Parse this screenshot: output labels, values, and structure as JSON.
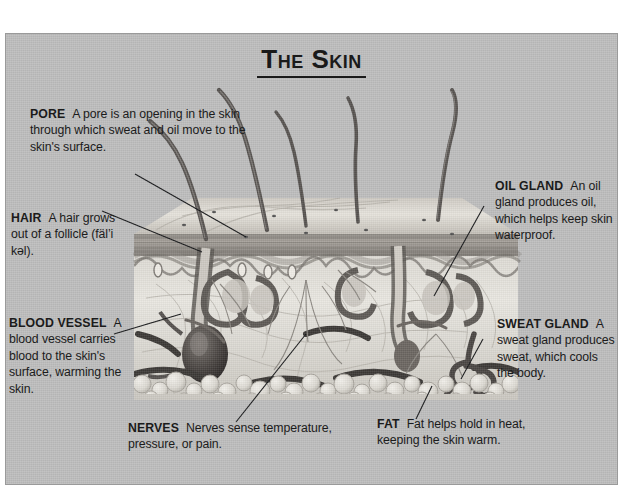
{
  "figure": {
    "title": "The Skin",
    "background_color": "#bdbdbd",
    "border_color": "#9a9a9a",
    "text_color": "#1b1b1b"
  },
  "callouts": [
    {
      "id": "pore",
      "term": "PORE",
      "text": "A pore is an opening in the skin through which sweat and oil move to the skin's surface."
    },
    {
      "id": "hair",
      "term": "HAIR",
      "text": "A hair grows out of a follicle (fäl’i kəl)."
    },
    {
      "id": "blood-vessel",
      "term": "BLOOD VESSEL",
      "text": "A blood vessel carries blood to the skin's surface, warming the skin."
    },
    {
      "id": "oil-gland",
      "term": "OIL GLAND",
      "text": "An oil gland produces oil, which helps keep skin waterproof."
    },
    {
      "id": "sweat-gland",
      "term": "SWEAT GLAND",
      "text": "A sweat gland produces sweat, which cools the body."
    },
    {
      "id": "nerves",
      "term": "NERVES",
      "text": "Nerves sense temperature, pressure, or pain."
    },
    {
      "id": "fat",
      "term": "FAT",
      "text": "Fat helps hold in heat, keeping the skin warm."
    }
  ],
  "illustration": {
    "name": "skin-cross-section",
    "description": "Grayscale cut-away drawing of human skin showing hairs, epidermis, dermis, follicles, oil glands, a sweat gland, blood vessels, nerves and fat layer.",
    "hair_count": 5
  }
}
